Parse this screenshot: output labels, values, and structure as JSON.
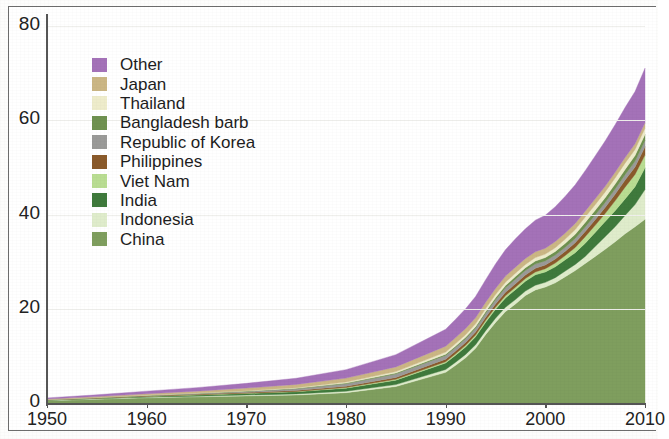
{
  "chart_data": {
    "type": "area",
    "stacked": true,
    "title": "",
    "subtitle": "",
    "xlabel": "",
    "ylabel": "",
    "xlim": [
      1950,
      2010
    ],
    "ylim": [
      0,
      80
    ],
    "grid": true,
    "legend_position": "upper-left-inside",
    "x_ticks": [
      "1950",
      "1960",
      "1970",
      "1980",
      "1990",
      "2000",
      "2010"
    ],
    "y_ticks": [
      "0",
      "20",
      "40",
      "60",
      "80"
    ],
    "x": [
      1950,
      1955,
      1960,
      1965,
      1970,
      1975,
      1980,
      1985,
      1990,
      1991,
      1992,
      1993,
      1994,
      1995,
      1996,
      1997,
      1998,
      1999,
      2000,
      2001,
      2002,
      2003,
      2004,
      2005,
      2006,
      2007,
      2008,
      2009,
      2010
    ],
    "stack_order_bottom_to_top": [
      "China",
      "Indonesia",
      "India",
      "Viet Nam",
      "Philippines",
      "Republic of Korea",
      "Bangladesh barb",
      "Thailand",
      "Japan",
      "Other"
    ],
    "series": [
      {
        "name": "China",
        "color": "#7f9e5e",
        "values": [
          0.5,
          0.8,
          1.1,
          1.3,
          1.5,
          1.7,
          2.2,
          3.5,
          6.5,
          8.0,
          9.6,
          11.6,
          14.5,
          17.1,
          19.4,
          21.0,
          22.8,
          24.0,
          24.6,
          25.5,
          26.8,
          28.1,
          29.6,
          31.1,
          32.6,
          34.2,
          35.9,
          37.4,
          39.0
        ]
      },
      {
        "name": "Indonesia",
        "color": "#dfeccb",
        "values": [
          0.05,
          0.08,
          0.12,
          0.15,
          0.18,
          0.23,
          0.3,
          0.4,
          0.6,
          0.65,
          0.7,
          0.75,
          0.8,
          0.87,
          0.9,
          0.95,
          0.95,
          1.0,
          1.0,
          1.1,
          1.2,
          1.3,
          1.5,
          2.1,
          2.7,
          3.2,
          3.9,
          4.7,
          6.3
        ]
      },
      {
        "name": "India",
        "color": "#3f7a3c",
        "values": [
          0.08,
          0.12,
          0.18,
          0.25,
          0.35,
          0.45,
          0.65,
          0.95,
          1.4,
          1.5,
          1.6,
          1.7,
          1.8,
          1.9,
          2.0,
          2.1,
          2.1,
          2.2,
          2.2,
          2.3,
          2.4,
          2.5,
          2.8,
          3.0,
          3.2,
          3.4,
          3.5,
          3.8,
          4.6
        ]
      },
      {
        "name": "Viet Nam",
        "color": "#b9dd92",
        "values": [
          0.01,
          0.02,
          0.03,
          0.04,
          0.06,
          0.08,
          0.12,
          0.18,
          0.26,
          0.3,
          0.33,
          0.37,
          0.4,
          0.44,
          0.48,
          0.52,
          0.56,
          0.6,
          0.7,
          0.8,
          0.9,
          1.1,
          1.4,
          1.5,
          1.7,
          2.1,
          2.5,
          2.6,
          2.7
        ]
      },
      {
        "name": "Philippines",
        "color": "#8a5a2b",
        "values": [
          0.05,
          0.07,
          0.09,
          0.12,
          0.15,
          0.2,
          0.28,
          0.4,
          0.55,
          0.57,
          0.6,
          0.62,
          0.65,
          0.68,
          0.7,
          0.72,
          0.75,
          0.78,
          0.8,
          0.85,
          0.9,
          1.0,
          1.1,
          1.2,
          1.3,
          1.4,
          1.5,
          1.6,
          1.8
        ]
      },
      {
        "name": "Republic of Korea",
        "color": "#9a9a98",
        "values": [
          0.02,
          0.05,
          0.09,
          0.14,
          0.22,
          0.35,
          0.55,
          0.75,
          0.79,
          0.8,
          0.82,
          0.83,
          0.85,
          0.9,
          0.95,
          0.98,
          0.95,
          0.9,
          0.85,
          0.85,
          0.85,
          0.9,
          0.95,
          1.0,
          1.05,
          1.1,
          1.15,
          1.2,
          1.3
        ]
      },
      {
        "name": "Bangladesh barb",
        "color": "#6f9150",
        "values": [
          0.01,
          0.02,
          0.03,
          0.05,
          0.07,
          0.1,
          0.13,
          0.18,
          0.25,
          0.28,
          0.3,
          0.33,
          0.37,
          0.42,
          0.48,
          0.55,
          0.6,
          0.65,
          0.7,
          0.76,
          0.83,
          0.9,
          0.95,
          0.98,
          1.0,
          1.05,
          1.1,
          1.2,
          1.3
        ]
      },
      {
        "name": "Thailand",
        "color": "#eeeccb",
        "values": [
          0.01,
          0.02,
          0.04,
          0.06,
          0.09,
          0.14,
          0.2,
          0.3,
          0.45,
          0.5,
          0.55,
          0.6,
          0.65,
          0.7,
          0.72,
          0.73,
          0.7,
          0.72,
          0.75,
          0.8,
          0.9,
          1.0,
          1.15,
          1.2,
          1.25,
          1.3,
          1.35,
          1.3,
          1.3
        ]
      },
      {
        "name": "Japan",
        "color": "#cbb684",
        "values": [
          0.1,
          0.18,
          0.28,
          0.4,
          0.55,
          0.7,
          0.85,
          1.0,
          1.25,
          1.28,
          1.3,
          1.3,
          1.3,
          1.3,
          1.3,
          1.28,
          1.25,
          1.25,
          1.25,
          1.3,
          1.3,
          1.3,
          1.25,
          1.25,
          1.2,
          1.2,
          1.2,
          1.2,
          1.15
        ]
      },
      {
        "name": "Other",
        "color": "#a472b8",
        "values": [
          0.25,
          0.38,
          0.55,
          0.75,
          1.0,
          1.3,
          1.8,
          2.6,
          3.6,
          3.9,
          4.2,
          4.5,
          4.8,
          5.2,
          5.6,
          6.0,
          6.3,
          6.7,
          7.0,
          7.4,
          7.8,
          8.2,
          8.6,
          9.1,
          9.6,
          10.1,
          10.6,
          11.1,
          11.6
        ]
      }
    ],
    "totals_note": "",
    "total_2010": 78
  },
  "legend": {
    "items": [
      {
        "label": "Other",
        "color": "#a472b8"
      },
      {
        "label": "Japan",
        "color": "#cbb684"
      },
      {
        "label": "Thailand",
        "color": "#eeeccb"
      },
      {
        "label": "Bangladesh barb",
        "color": "#6f9150"
      },
      {
        "label": "Republic of Korea",
        "color": "#9a9a98"
      },
      {
        "label": "Philippines",
        "color": "#8a5a2b"
      },
      {
        "label": "Viet Nam",
        "color": "#b9dd92"
      },
      {
        "label": "India",
        "color": "#3f7a3c"
      },
      {
        "label": "Indonesia",
        "color": "#dfeccb"
      },
      {
        "label": "China",
        "color": "#7f9e5e"
      }
    ]
  },
  "axes": {
    "y_ticks": [
      "80",
      "60",
      "40",
      "20",
      "0"
    ],
    "x_ticks": [
      "1950",
      "1960",
      "1970",
      "1980",
      "1990",
      "2000",
      "2010"
    ]
  }
}
